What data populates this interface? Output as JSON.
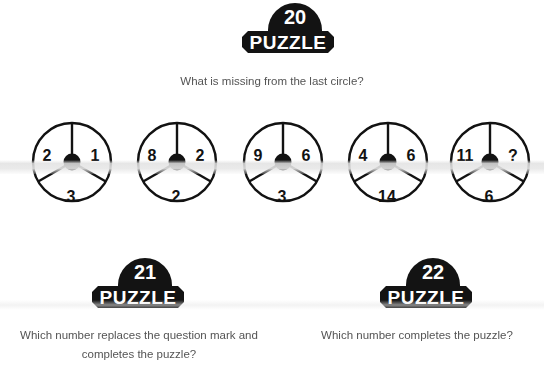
{
  "page": {
    "background": "#ffffff",
    "ink": "#131313",
    "text_color": "#545454"
  },
  "puzzles": [
    {
      "badge_number": "20",
      "badge_word": "PUZZLE",
      "question": "What is missing from the last circle?"
    },
    {
      "badge_number": "21",
      "badge_word": "PUZZLE",
      "question": "Which number replaces the question mark and completes the puzzle?"
    },
    {
      "badge_number": "22",
      "badge_word": "PUZZLE",
      "question": "Which number completes the puzzle?"
    }
  ],
  "circles": [
    {
      "index": 1,
      "left": "2",
      "right": "1",
      "bottom": "3"
    },
    {
      "index": 2,
      "left": "8",
      "right": "2",
      "bottom": "2"
    },
    {
      "index": 3,
      "left": "9",
      "right": "6",
      "bottom": "3"
    },
    {
      "index": 4,
      "left": "4",
      "right": "6",
      "bottom": "14"
    },
    {
      "index": 5,
      "left": "11",
      "right": "?",
      "bottom": "6"
    }
  ]
}
